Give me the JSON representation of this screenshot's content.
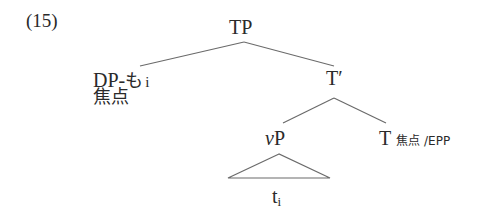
{
  "example_number": "(15)",
  "tree": {
    "root": {
      "label": "TP"
    },
    "specifier": {
      "label_main": "DP-",
      "label_particle": "も",
      "label_index": "i",
      "feature": "焦点"
    },
    "t_bar": {
      "label": "T′"
    },
    "vP": {
      "label_v": "v",
      "label_P": "P",
      "trace": "t",
      "trace_index": "i"
    },
    "head_T": {
      "label": "T",
      "features": "焦点 /EPP"
    }
  },
  "colors": {
    "text": "#2a2a2a",
    "lines": "#6a6a6a",
    "background": "#ffffff"
  }
}
